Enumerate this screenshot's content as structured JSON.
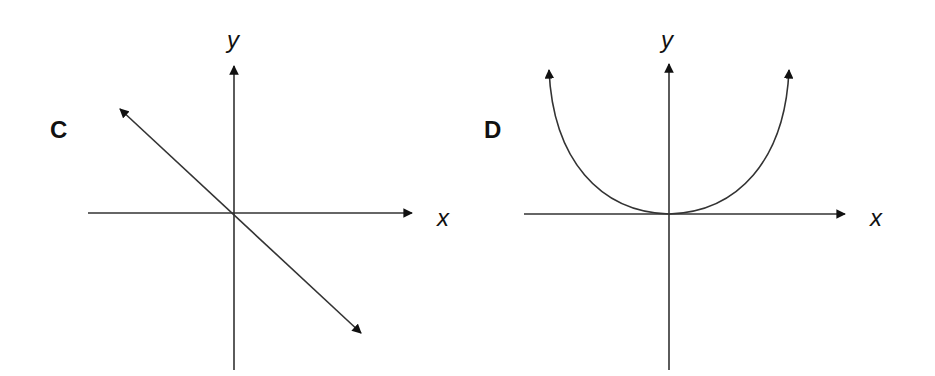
{
  "diagrams": [
    {
      "id": "C",
      "label": "C",
      "x_axis_label": "x",
      "y_axis_label": "y",
      "curve": "straight line through origin with negative slope, arrows at both ends"
    },
    {
      "id": "D",
      "label": "D",
      "x_axis_label": "x",
      "y_axis_label": "y",
      "curve": "upward-opening curve with vertex at origin, arrows at both ends"
    }
  ],
  "colors": {
    "line": "#222222",
    "background": "#ffffff"
  }
}
